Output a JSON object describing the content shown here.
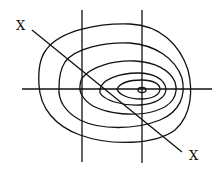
{
  "diagram": {
    "type": "contour-plot",
    "colors": {
      "stroke": "#111111",
      "background": "#ffffff"
    },
    "labels": {
      "diagonal_start": "X",
      "diagonal_end": "X"
    },
    "lines": {
      "horizontal": {
        "x1": 22,
        "y1": 89,
        "x2": 212,
        "y2": 89
      },
      "vertical_left": {
        "x1": 82,
        "y1": 10,
        "x2": 82,
        "y2": 162
      },
      "vertical_right": {
        "x1": 142,
        "y1": 10,
        "x2": 142,
        "y2": 163
      },
      "diagonal": {
        "x1": 32,
        "y1": 30,
        "x2": 182,
        "y2": 152
      }
    },
    "contour_count": 6,
    "center": {
      "x": 142,
      "y": 90
    }
  }
}
